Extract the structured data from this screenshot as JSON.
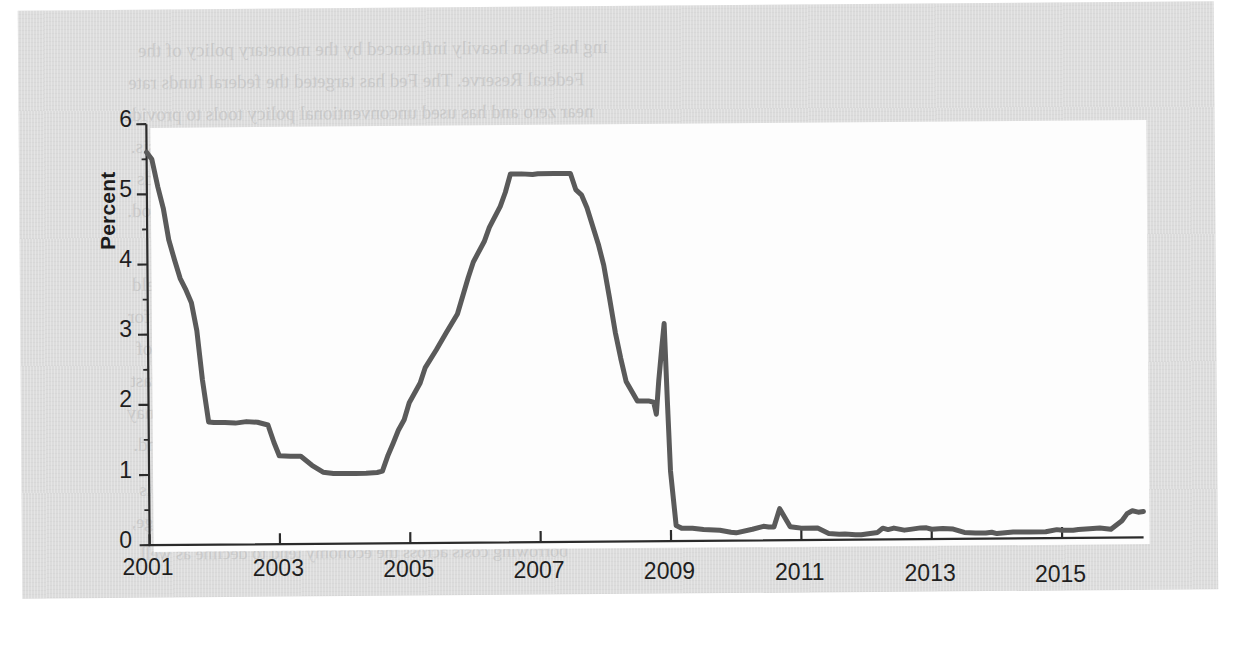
{
  "figure": {
    "y_axis_title": "Percent",
    "line_color": "#5a5a5a",
    "axis_color": "#2b2b2b",
    "page_color": "#dcdcdc",
    "panel_color": "#fdfdfd"
  },
  "bleed_text": [
    "ing has been heavily influenced by the monetary policy of the",
    "Federal Reserve. The Fed has targeted the federal funds rate",
    "near zero and has used unconventional policy tools to provide",
    "additional stimulus to the economy since the financial crisis.",
    "Two key factors shaped the level at which the federal funds",
    "rate was set during this extended period.",
    "Liquidity, the Fed  The Fed funds target rate has persisted",
    "at a historically low level for a long time, allowing the yield",
    "curve to remain steep, which may reduce the incentive for",
    "some depository institutions to lend. The transmission of",
    "monetary policy to the real economy is the subject of a vast",
    "body of research. The reserves held at the central bank may",
    "expand or contract according to shifts in aggregate demand.",
    "Example. A firm that borrows from a bank pays a rate that is",
    "tied to the benchmark. When the Fed lowers the target range,",
    "borrowing costs across the economy tend to decline as well."
  ],
  "chart_data": {
    "type": "line",
    "title": "",
    "xlabel": "",
    "ylabel": "Percent",
    "xlim": [
      2001.0,
      2016.25
    ],
    "ylim": [
      0,
      6
    ],
    "yticks": [
      0,
      1,
      2,
      3,
      4,
      5,
      6
    ],
    "ytick_labels": [
      "0",
      "1",
      "2",
      "3",
      "4",
      "5",
      "6"
    ],
    "xticks": [
      2001,
      2003,
      2005,
      2007,
      2009,
      2011,
      2013,
      2015
    ],
    "xtick_labels": [
      "2001",
      "2003",
      "2005",
      "2007",
      "2009",
      "2011",
      "2013",
      "2015"
    ],
    "grid": false,
    "legend": false,
    "series": [
      {
        "name": "Federal funds rate",
        "color": "#5a5a5a",
        "x": [
          2001.0,
          2001.08,
          2001.17,
          2001.25,
          2001.33,
          2001.42,
          2001.5,
          2001.58,
          2001.67,
          2001.75,
          2001.83,
          2001.92,
          2002.0,
          2002.17,
          2002.33,
          2002.5,
          2002.67,
          2002.83,
          2002.92,
          2003.0,
          2003.17,
          2003.33,
          2003.5,
          2003.67,
          2003.83,
          2004.0,
          2004.17,
          2004.33,
          2004.5,
          2004.58,
          2004.67,
          2004.75,
          2004.83,
          2004.92,
          2005.0,
          2005.17,
          2005.25,
          2005.42,
          2005.58,
          2005.75,
          2005.92,
          2006.0,
          2006.17,
          2006.25,
          2006.42,
          2006.5,
          2006.58,
          2006.75,
          2006.92,
          2007.0,
          2007.25,
          2007.5,
          2007.58,
          2007.67,
          2007.75,
          2007.92,
          2008.0,
          2008.08,
          2008.17,
          2008.25,
          2008.33,
          2008.5,
          2008.67,
          2008.75,
          2008.79,
          2008.83,
          2008.88,
          2008.92,
          2008.96,
          2009.0,
          2009.08,
          2009.17,
          2009.33,
          2009.5,
          2009.75,
          2009.92,
          2010.0,
          2010.25,
          2010.42,
          2010.5,
          2010.58,
          2010.67,
          2010.83,
          2010.92,
          2011.0,
          2011.25,
          2011.42,
          2011.58,
          2011.67,
          2011.83,
          2011.92,
          2012.0,
          2012.17,
          2012.25,
          2012.33,
          2012.42,
          2012.58,
          2012.67,
          2012.83,
          2012.92,
          2013.0,
          2013.17,
          2013.33,
          2013.5,
          2013.67,
          2013.83,
          2013.92,
          2014.0,
          2014.25,
          2014.5,
          2014.75,
          2014.92,
          2015.0,
          2015.17,
          2015.25,
          2015.42,
          2015.58,
          2015.75,
          2015.92,
          2016.0,
          2016.08,
          2016.17,
          2016.25
        ],
        "y": [
          5.6,
          5.5,
          5.1,
          4.8,
          4.35,
          4.05,
          3.8,
          3.65,
          3.45,
          3.05,
          2.35,
          1.75,
          1.74,
          1.74,
          1.73,
          1.75,
          1.74,
          1.7,
          1.45,
          1.26,
          1.25,
          1.25,
          1.12,
          1.02,
          1.0,
          1.0,
          1.0,
          1.0,
          1.01,
          1.03,
          1.26,
          1.43,
          1.61,
          1.76,
          2.0,
          2.28,
          2.5,
          2.75,
          3.0,
          3.26,
          3.78,
          4.0,
          4.29,
          4.49,
          4.79,
          4.99,
          5.25,
          5.25,
          5.24,
          5.25,
          5.25,
          5.25,
          5.02,
          4.94,
          4.76,
          4.24,
          3.94,
          3.5,
          2.98,
          2.61,
          2.28,
          2.0,
          2.0,
          1.98,
          1.81,
          2.28,
          2.75,
          3.1,
          2.0,
          1.0,
          0.22,
          0.18,
          0.18,
          0.16,
          0.15,
          0.12,
          0.11,
          0.16,
          0.2,
          0.19,
          0.19,
          0.45,
          0.19,
          0.18,
          0.17,
          0.17,
          0.09,
          0.08,
          0.08,
          0.07,
          0.07,
          0.08,
          0.1,
          0.16,
          0.14,
          0.16,
          0.13,
          0.14,
          0.16,
          0.16,
          0.14,
          0.15,
          0.14,
          0.09,
          0.08,
          0.08,
          0.09,
          0.07,
          0.09,
          0.09,
          0.09,
          0.12,
          0.11,
          0.11,
          0.12,
          0.13,
          0.14,
          0.12,
          0.24,
          0.34,
          0.38,
          0.36,
          0.37
        ]
      }
    ]
  }
}
